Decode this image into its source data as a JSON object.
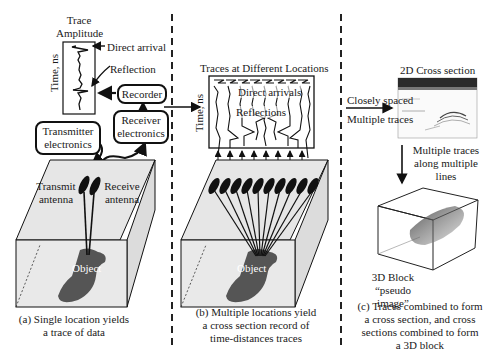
{
  "panel_a": {
    "trace_title_line1": "Trace",
    "trace_title_line2": "Amplitude",
    "time_axis": "Time, ns",
    "direct_arrival": "Direct arrival",
    "reflection": "Reflection",
    "recorder": "Recorder",
    "receiver_electronics_line1": "Receiver",
    "receiver_electronics_line2": "electronics",
    "transmitter_electronics_line1": "Transmitter",
    "transmitter_electronics_line2": "electronics",
    "transmit_antenna_line1": "Transmit",
    "transmit_antenna_line2": "antenna",
    "receive_antenna_line1": "Receive",
    "receive_antenna_line2": "antenna",
    "object": "Object",
    "caption_line1": "(a) Single location yields",
    "caption_line2": "a trace of data"
  },
  "panel_b": {
    "traces_title": "Traces at Different Locations",
    "time_axis": "Time, ns",
    "direct_arrivals": "Direct arrivals",
    "reflections": "Reflections",
    "object": "Object",
    "caption_line1": "(b) Multiple locations yield",
    "caption_line2": "a cross section record of",
    "caption_line3": "time-distances traces"
  },
  "panel_c": {
    "closely_spaced": "Closely spaced",
    "multiple_traces": "Multiple traces",
    "cross_section_title": "2D Cross section",
    "multiple_traces_lines_line1": "Multiple traces",
    "multiple_traces_lines_line2": "along multiple",
    "multiple_traces_lines_line3": "lines",
    "block_label_line1": "3D Block",
    "block_label_line2": "“pseudo image”",
    "caption_line1": "(c) Traces combined to form",
    "caption_line2": "a cross section, and cross",
    "caption_line3": "sections combined to form",
    "caption_line4": "a 3D block"
  },
  "colors": {
    "ground_fill": "#e6e6e6",
    "object_fill": "#555555",
    "line": "#111111"
  }
}
